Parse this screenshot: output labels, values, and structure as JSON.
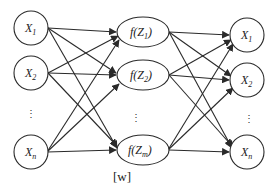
{
  "diagram": {
    "type": "fully-connected network (input -> hidden -> output)",
    "caption": "[w]",
    "colors": {
      "stroke": "#2a2a2a",
      "fill": "#ffffff"
    },
    "layers": [
      {
        "name": "input",
        "shape": "circle",
        "nodes": [
          {
            "base": "X",
            "sub": "1"
          },
          {
            "base": "X",
            "sub": "2"
          },
          {
            "base": "X",
            "sub": "n"
          }
        ],
        "ellipsis": "⋮"
      },
      {
        "name": "hidden",
        "shape": "ellipse",
        "nodes": [
          {
            "prefix": "f(",
            "base": "Z",
            "sub": "1",
            "suffix": ")"
          },
          {
            "prefix": "f(",
            "base": "Z",
            "sub": "2",
            "suffix": ")"
          },
          {
            "prefix": "f(",
            "base": "Z",
            "sub": "m",
            "suffix": ")"
          }
        ],
        "ellipsis": "⋮"
      },
      {
        "name": "output",
        "shape": "circle",
        "nodes": [
          {
            "base": "X",
            "sub": "1"
          },
          {
            "base": "X",
            "sub": "2"
          },
          {
            "base": "X",
            "sub": "n"
          }
        ],
        "ellipsis": "⋮"
      }
    ],
    "connections": "every node of each layer connects with an arrow to every node of the next layer"
  }
}
